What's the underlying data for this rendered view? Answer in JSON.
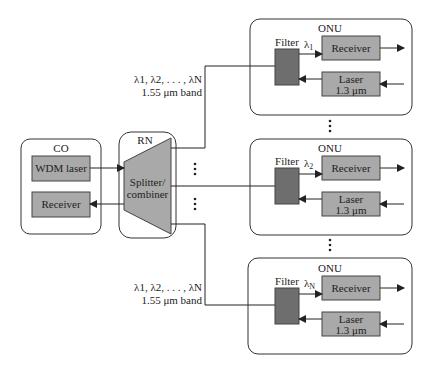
{
  "colors": {
    "box_fill": "#a9a9a9",
    "filter_fill": "#6e6e6e",
    "splitter_fill": "#a9a9a9",
    "stroke": "#333333",
    "background": "#ffffff"
  },
  "co": {
    "title": "CO",
    "wdm_laser": "WDM laser",
    "receiver": "Receiver"
  },
  "rn": {
    "title": "RN",
    "splitter_line1": "Splitter/",
    "splitter_line2": "combiner"
  },
  "band_label_top": {
    "line1": "λ1, λ2, . . . , λN",
    "line2": "1.55 μm band"
  },
  "band_label_bottom": {
    "line1": "λ1, λ2, . . . , λN",
    "line2": "1.55 μm band"
  },
  "onus": [
    {
      "title": "ONU",
      "filter": "Filter",
      "lambda": "λ",
      "lambda_sub": "1",
      "receiver": "Receiver",
      "laser_line1": "Laser",
      "laser_line2": "1.3 μm"
    },
    {
      "title": "ONU",
      "filter": "Filter",
      "lambda": "λ",
      "lambda_sub": "2",
      "receiver": "Receiver",
      "laser_line1": "Laser",
      "laser_line2": "1.3 μm"
    },
    {
      "title": "ONU",
      "filter": "Filter",
      "lambda": "λ",
      "lambda_sub": "N",
      "receiver": "Receiver",
      "laser_line1": "Laser",
      "laser_line2": "1.3 μm"
    }
  ],
  "ellipsis": "⋮"
}
